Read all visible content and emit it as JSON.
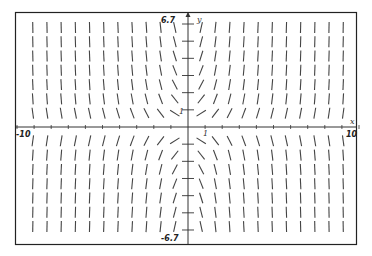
{
  "chart_data": {
    "type": "slope_field",
    "title": "",
    "equation_inferred": "dy/dx = x*y",
    "xlabel": "x",
    "ylabel": "y",
    "xlim": [
      -10,
      10
    ],
    "ylim": [
      -6.7,
      6.7
    ],
    "x_tick_labels": {
      "min": "-10",
      "max": "10",
      "unit": "1"
    },
    "y_tick_labels": {
      "min": "-6.7",
      "max": "6.7",
      "unit": "1"
    },
    "grid": false,
    "legend": null,
    "grid_columns_per_side": 11,
    "grid_rows_per_side": 7,
    "grid_step": 0.833,
    "x_ticks": [
      -10,
      -9,
      -8,
      -7,
      -6,
      -5,
      -4,
      -3,
      -2,
      -1,
      1,
      2,
      3,
      4,
      5,
      6,
      7,
      8,
      9,
      10
    ],
    "y_ticks": [
      -6,
      -5,
      -4,
      -3,
      -2,
      -1,
      1,
      2,
      3,
      4,
      5,
      6
    ],
    "segment_color": "#444444",
    "axis_color": "#333333",
    "frame_color": "#222222"
  },
  "labels": {
    "x_min": "-10",
    "x_max": "10",
    "y_max": "6.7",
    "y_min": "-6.7",
    "x_unit": "1",
    "y_unit": "1",
    "x_name": "x",
    "y_name": "y"
  }
}
